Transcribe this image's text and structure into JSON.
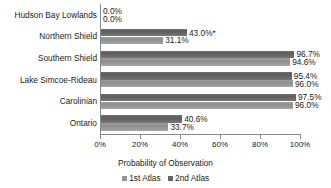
{
  "chart_data": {
    "type": "bar",
    "orientation": "horizontal",
    "title": "",
    "xlabel": "Probability of Observation",
    "ylabel": "",
    "xlim": [
      0,
      100
    ],
    "xtick_labels": [
      "0%",
      "20%",
      "40%",
      "60%",
      "80%",
      "100%"
    ],
    "xticks": [
      0,
      20,
      40,
      60,
      80,
      100
    ],
    "grid": false,
    "legend_position": "bottom",
    "categories": [
      "Hudson Bay Lowlands",
      "Northern Shield",
      "Southern Shield",
      "Lake Simcoe-Rideau",
      "Carolinian",
      "Ontario"
    ],
    "series": [
      {
        "name": "2nd Atlas",
        "color": "#666666",
        "values": [
          0.0,
          43.0,
          96.7,
          95.4,
          97.5,
          40.6
        ],
        "labels": [
          "0.0%",
          "43.0%*",
          "96.7%",
          "95.4%",
          "97.5%",
          "40.6%"
        ]
      },
      {
        "name": "1st Atlas",
        "color": "#969696",
        "values": [
          0.0,
          31.1,
          94.6,
          96.0,
          96.0,
          33.7
        ],
        "labels": [
          "0.0%",
          "31.1%",
          "94.6%",
          "96.0%",
          "96.0%",
          "33.7%"
        ]
      }
    ],
    "annotations": [
      "* indicates a significant change"
    ]
  },
  "legend": {
    "items": [
      {
        "label": "1st Atlas",
        "swatch": "first"
      },
      {
        "label": "2nd Atlas",
        "swatch": "second"
      }
    ]
  }
}
